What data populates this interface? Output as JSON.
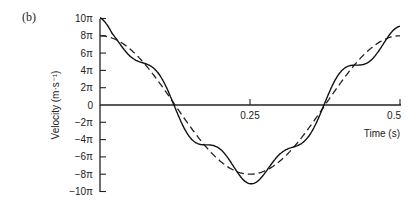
{
  "panel_label": "(b)",
  "chart_data": {
    "type": "line",
    "title": "",
    "xlabel": "Time (s)",
    "ylabel": "Velocity (m·s⁻¹)",
    "xlim": [
      0,
      0.5
    ],
    "ylim": [
      -10,
      10
    ],
    "y_unit": "π",
    "x_ticks": [
      "0.25",
      "0.5"
    ],
    "x_tick_values": [
      0.25,
      0.5
    ],
    "y_tick_labels": [
      "10π",
      "8π",
      "6π",
      "4π",
      "2π",
      "0",
      "−2π",
      "−4π",
      "−6π",
      "−8π",
      "−10π"
    ],
    "y_tick_values": [
      10,
      8,
      6,
      4,
      2,
      0,
      -2,
      -4,
      -6,
      -8,
      -10
    ],
    "grid": false,
    "legend": false,
    "series": [
      {
        "name": "measured (solid)",
        "style": "solid",
        "description": "8π·cos(4πt) with superimposed higher-frequency ripple",
        "x": [
          0,
          0.05,
          0.1,
          0.15,
          0.2,
          0.25,
          0.3,
          0.35,
          0.4,
          0.45,
          0.5
        ],
        "y": [
          9,
          7.5,
          4,
          -1,
          -6,
          -7.5,
          -7.5,
          -2,
          4,
          7.5,
          9.5
        ]
      },
      {
        "name": "fundamental (dashed)",
        "style": "dashed",
        "description": "8π·cos(4πt)",
        "x": [
          0,
          0.0625,
          0.125,
          0.1875,
          0.25,
          0.3125,
          0.375,
          0.4375,
          0.5
        ],
        "y": [
          8,
          5.66,
          0,
          -5.66,
          -8,
          -5.66,
          0,
          5.66,
          8
        ]
      }
    ]
  }
}
